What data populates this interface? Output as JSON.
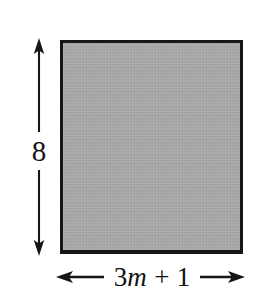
{
  "figure": {
    "name": "shaded-rectangle-with-dimensions",
    "shape": {
      "type": "rectangle",
      "fill_color": "#a8a8a8",
      "stroke_color": "#161616"
    },
    "background_color": "#ffffff",
    "dimensions": {
      "height": {
        "label": "8",
        "orientation": "vertical",
        "arrow_style": "double-headed",
        "position": "left"
      },
      "width": {
        "label_full": "3m + 1",
        "label_coefficient": "3",
        "label_variable": "m",
        "label_operator": "+",
        "label_constant": "1",
        "orientation": "horizontal",
        "arrow_style": "double-headed",
        "position": "bottom"
      }
    }
  }
}
